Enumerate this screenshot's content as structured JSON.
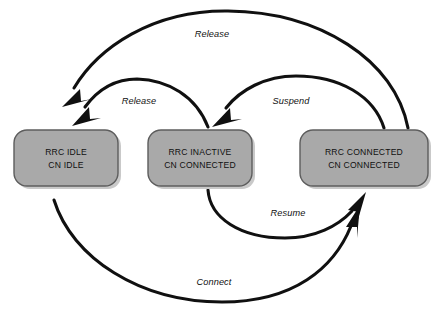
{
  "diagram": {
    "background_color": "#ffffff",
    "box_fill_color": "#a9a9a9",
    "box_border_color": "#5d5d5d",
    "arrow_color": "#101010",
    "states": [
      {
        "id": "rrc-idle",
        "line1": "RRC IDLE",
        "line2": "CN IDLE",
        "x": 14,
        "y": 130,
        "width": 104,
        "height": 56
      },
      {
        "id": "rrc-inactive",
        "line1": "RRC INACTIVE",
        "line2": "CN CONNECTED",
        "x": 148,
        "y": 130,
        "width": 104,
        "height": 56
      },
      {
        "id": "rrc-connected",
        "line1": "RRC CONNECTED",
        "line2": "CN CONNECTED",
        "x": 300,
        "y": 130,
        "width": 128,
        "height": 56
      }
    ],
    "transitions": [
      {
        "id": "release-connected-to-idle",
        "label": "Release",
        "from": "rrc-connected",
        "to": "rrc-idle",
        "label_x": 212,
        "label_y": 37
      },
      {
        "id": "release-inactive-to-idle",
        "label": "Release",
        "from": "rrc-inactive",
        "to": "rrc-idle",
        "label_x": 139,
        "label_y": 104
      },
      {
        "id": "suspend-connected-to-inactive",
        "label": "Suspend",
        "from": "rrc-connected",
        "to": "rrc-inactive",
        "label_x": 291,
        "label_y": 104
      },
      {
        "id": "resume-inactive-to-connected",
        "label": "Resume",
        "from": "rrc-inactive",
        "to": "rrc-connected",
        "label_x": 288,
        "label_y": 216
      },
      {
        "id": "connect-idle-to-connected",
        "label": "Connect",
        "from": "rrc-idle",
        "to": "rrc-connected",
        "label_x": 214,
        "label_y": 285
      }
    ]
  }
}
